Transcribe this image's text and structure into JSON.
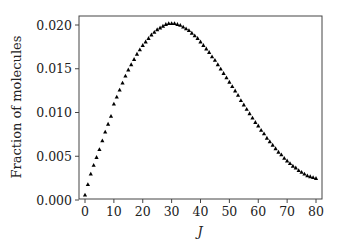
{
  "chart_data": {
    "type": "scatter",
    "title": "",
    "xlabel": "J",
    "ylabel": "Fraction of molecules",
    "xlim": [
      -2,
      82
    ],
    "ylim": [
      0.0,
      0.0205
    ],
    "xticks": [
      0,
      10,
      20,
      30,
      40,
      50,
      60,
      70,
      80
    ],
    "xtick_labels": [
      "0",
      "10",
      "20",
      "30",
      "40",
      "50",
      "60",
      "70",
      "80"
    ],
    "yticks": [
      0.0,
      0.005,
      0.01,
      0.015,
      0.02
    ],
    "ytick_labels": [
      "0.000",
      "0.005",
      "0.010",
      "0.015",
      "0.020"
    ],
    "grid": false,
    "legend": null,
    "marker": "triangle-up",
    "marker_color": "#000000",
    "data_note": "Values digitized from image. Anchor points read directly off the plot; intermediate points are smoothed estimates, not exact. Approximate curve: rises from ~0.0006 at J=0, peaks ~0.0202 near J=30, falls to ~0.0025 at J=80.",
    "anchors": [
      {
        "J": 0,
        "value": 0.0006
      },
      {
        "J": 1,
        "value": 0.0018
      },
      {
        "J": 2,
        "value": 0.003
      },
      {
        "J": 5,
        "value": 0.0058
      },
      {
        "J": 10,
        "value": 0.011
      },
      {
        "J": 13,
        "value": 0.0134
      },
      {
        "J": 30,
        "value": 0.0202
      },
      {
        "J": 80,
        "value": 0.0025
      }
    ],
    "x": [
      0,
      1,
      2,
      3,
      4,
      5,
      6,
      7,
      8,
      9,
      10,
      11,
      12,
      13,
      14,
      15,
      16,
      17,
      18,
      19,
      20,
      21,
      22,
      23,
      24,
      25,
      26,
      27,
      28,
      29,
      30,
      31,
      32,
      33,
      34,
      35,
      36,
      37,
      38,
      39,
      40,
      41,
      42,
      43,
      44,
      45,
      46,
      47,
      48,
      49,
      50,
      51,
      52,
      53,
      54,
      55,
      56,
      57,
      58,
      59,
      60,
      61,
      62,
      63,
      64,
      65,
      66,
      67,
      68,
      69,
      70,
      71,
      72,
      73,
      74,
      75,
      76,
      77,
      78,
      79,
      80
    ],
    "values": [
      0.0006,
      0.0018,
      0.003,
      0.004,
      0.0049,
      0.0058,
      0.0068,
      0.0078,
      0.0087,
      0.0096,
      0.011,
      0.0118,
      0.0126,
      0.0134,
      0.0142,
      0.0149,
      0.0155,
      0.0161,
      0.0167,
      0.0172,
      0.0177,
      0.0181,
      0.0185,
      0.0189,
      0.0192,
      0.0195,
      0.0197,
      0.0199,
      0.0201,
      0.0202,
      0.0202,
      0.0202,
      0.0201,
      0.02,
      0.0198,
      0.0196,
      0.0194,
      0.0191,
      0.0188,
      0.0185,
      0.0181,
      0.0177,
      0.0173,
      0.0169,
      0.0164,
      0.016,
      0.0155,
      0.015,
      0.0145,
      0.014,
      0.0135,
      0.013,
      0.0125,
      0.012,
      0.0114,
      0.0109,
      0.0104,
      0.0099,
      0.0094,
      0.0089,
      0.0085,
      0.008,
      0.0076,
      0.0071,
      0.0067,
      0.0063,
      0.0059,
      0.0055,
      0.0052,
      0.0048,
      0.0045,
      0.0042,
      0.0039,
      0.0037,
      0.0034,
      0.0032,
      0.003,
      0.0028,
      0.0027,
      0.0026,
      0.0025
    ]
  },
  "layout": {
    "frame": {
      "left": 79,
      "top": 16,
      "right": 322,
      "bottom": 199
    },
    "x_px": {
      "at_0": 85,
      "at_80": 316
    },
    "y_px": {
      "at_0": 200,
      "at_0_020": 25
    }
  }
}
